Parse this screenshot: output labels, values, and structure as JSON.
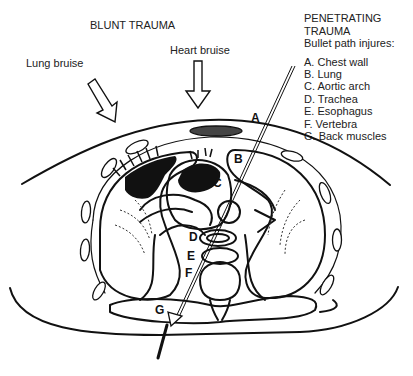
{
  "diagram": {
    "blunt_title": "BLUNT TRAUMA",
    "lung_bruise": "Lung bruise",
    "heart_bruise": "Heart bruise",
    "penetrating": {
      "title_line1": "PENETRATING",
      "title_line2": "TRAUMA",
      "subtitle": "Bullet path injures:",
      "items": [
        "A. Chest wall",
        "B. Lung",
        "C. Aortic arch",
        "D. Trachea",
        "E. Esophagus",
        "F. Vertebra",
        "G. Back muscles"
      ]
    },
    "markers": {
      "A": "A",
      "B": "B",
      "C": "C",
      "D": "D",
      "E": "E",
      "F": "F",
      "G": "G"
    },
    "colors": {
      "ink": "#111111",
      "background": "#ffffff"
    }
  }
}
